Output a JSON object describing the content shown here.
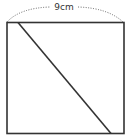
{
  "diagram": {
    "type": "square-with-diagonal",
    "dimension_label": "9cm",
    "colors": {
      "stroke": "#333333",
      "dotted": "#555555",
      "background": "#ffffff"
    }
  }
}
